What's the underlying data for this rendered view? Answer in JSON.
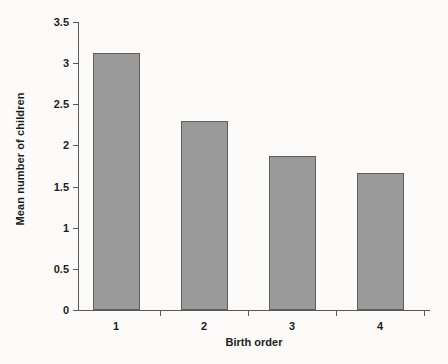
{
  "chart_data": {
    "type": "bar",
    "title": "",
    "subtitle": "",
    "xlabel": "Birth order",
    "ylabel": "Mean number of children",
    "categories": [
      "1",
      "2",
      "3",
      "4"
    ],
    "values": [
      3.12,
      2.3,
      1.87,
      1.66
    ],
    "series": [
      {
        "name": "Mean number of children",
        "values": [
          3.12,
          2.3,
          1.87,
          1.66
        ]
      }
    ],
    "ylim": [
      0,
      3.5
    ],
    "yticks": [
      "0",
      "0.5",
      "1",
      "1.5",
      "2",
      "2.5",
      "3",
      "3.5"
    ],
    "ytick_values": [
      0,
      0.5,
      1,
      1.5,
      2,
      2.5,
      3,
      3.5
    ],
    "xticks": [
      "1",
      "2",
      "3",
      "4"
    ],
    "grid": false,
    "legend": false,
    "legend_position": "none",
    "colors": {
      "bar_fill": "#9a9a9a",
      "bar_edge": "#5e5e5e",
      "axis": "#59595a",
      "text": "#1b1b1b",
      "background": "#fcfbf9"
    }
  }
}
